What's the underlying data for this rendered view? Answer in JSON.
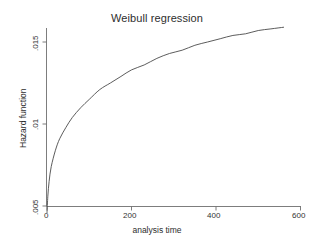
{
  "chart_data": {
    "type": "line",
    "title": "Weibull regression",
    "xlabel": "analysis time",
    "ylabel": "Hazard function",
    "xlim": [
      0,
      620
    ],
    "ylim": [
      0.0045,
      0.0158
    ],
    "xticks": [
      0,
      200,
      400,
      600
    ],
    "xticklabels": [
      "0",
      "200",
      "400",
      "600"
    ],
    "yticks": [
      0.005,
      0.01,
      0.015
    ],
    "yticklabels": [
      ".005",
      ".01",
      ".015"
    ],
    "grid": false,
    "legend": false,
    "series": [
      {
        "name": "Hazard function",
        "x": [
          0,
          2,
          5,
          10,
          20,
          30,
          45,
          60,
          80,
          100,
          125,
          150,
          175,
          200,
          230,
          260,
          290,
          320,
          350,
          380,
          410,
          440,
          470,
          500,
          530,
          560
        ],
        "y": [
          0.0046,
          0.0056,
          0.0065,
          0.0074,
          0.0084,
          0.0091,
          0.0098,
          0.0104,
          0.011,
          0.0115,
          0.0121,
          0.0125,
          0.0129,
          0.0133,
          0.0136,
          0.014,
          0.0143,
          0.0145,
          0.0148,
          0.015,
          0.0152,
          0.0154,
          0.0155,
          0.0157,
          0.0158,
          0.0159
        ]
      }
    ],
    "curve_color": "#4a4a4a",
    "axis_color": "#6e6e6e",
    "background_color": "#ffffff"
  },
  "axes": {
    "title": "Weibull regression",
    "x_title": "analysis time",
    "y_title": "Hazard function",
    "x_tick_labels": [
      "0",
      "200",
      "400",
      "600"
    ],
    "y_tick_labels": [
      ".005",
      ".01",
      ".015"
    ]
  }
}
